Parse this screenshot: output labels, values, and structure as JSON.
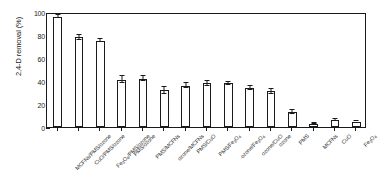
{
  "chart_data": {
    "type": "bar",
    "title": "",
    "xlabel": "",
    "ylabel": "2,4-D removal (%)",
    "ylim": [
      0,
      100
    ],
    "yticks": [
      0,
      20,
      40,
      60,
      80,
      100
    ],
    "grid": false,
    "legend": "none",
    "bar_style": {
      "fill": "#ffffff",
      "edge": "#1a1a1a",
      "error_bars": true
    },
    "categories": [
      "MCFNs/PMS/ozone",
      "CuO/PMS/ozone",
      "Fe3O4/PMS/ozone",
      "PMS/ozone",
      "PMS/MCFNs",
      "ozone/MCFNs",
      "PMS/CuO",
      "PMS/Fe3O4",
      "ozone/Fe3O4",
      "ozone/CuO",
      "ozone",
      "PMS",
      "MCFNs",
      "CuO",
      "Fe3O4"
    ],
    "category_labels_html": [
      "MCFNs/PMS/ozone",
      "CuO/PMS/ozone",
      "Fe<sub>3</sub>O<sub>4</sub>/PMS/ozone",
      "PMS/ozone",
      "PMS/MCFNs",
      "ozone/MCFNs",
      "PMS/CuO",
      "PMS/Fe<sub>3</sub>O<sub>4</sub>",
      "ozone/Fe<sub>3</sub>O<sub>4</sub>",
      "ozone/CuO",
      "ozone",
      "PMS",
      "MCFNs",
      "CuO",
      "Fe<sub>3</sub>O<sub>4</sub>"
    ],
    "values": [
      96,
      78,
      75,
      41,
      42,
      32,
      36,
      38,
      38,
      34,
      31,
      13,
      3,
      6,
      4
    ],
    "errors": [
      1.5,
      2.0,
      1.5,
      3.0,
      2.0,
      3.0,
      2.5,
      2.0,
      1.5,
      2.0,
      2.0,
      2.0,
      0.8,
      1.0,
      0.8
    ],
    "values_last_two": [
      4,
      5
    ]
  },
  "axes": {
    "y_tick_labels": [
      "0",
      "20",
      "40",
      "60",
      "80",
      "100"
    ],
    "y_axis_title": "2,4-D removal (%)"
  },
  "colors": {
    "axis": "#1a1a1a",
    "bar_fill": "#ffffff",
    "bar_edge": "#1a1a1a",
    "background": "#ffffff"
  }
}
